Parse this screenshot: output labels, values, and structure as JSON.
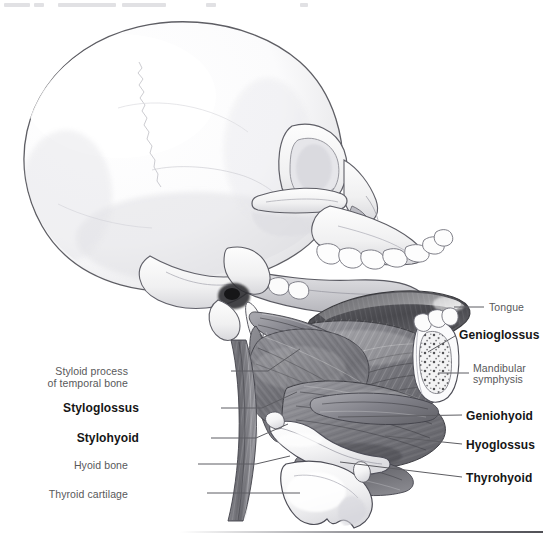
{
  "figure": {
    "style": "grayscale pencil medical illustration",
    "bottom_rule": true
  },
  "labels": [
    {
      "id": "tongue",
      "text": "Tongue",
      "emphasis": "plain",
      "align": "left",
      "side": "right",
      "x": 489,
      "y": 301,
      "leader": [
        [
          454,
          307
        ],
        [
          484,
          307
        ]
      ]
    },
    {
      "id": "genioglossus",
      "text": "Genioglossus",
      "emphasis": "bold",
      "align": "left",
      "side": "right",
      "x": 459,
      "y": 328,
      "leader": [
        [
          428,
          352
        ],
        [
          455,
          336
        ]
      ]
    },
    {
      "id": "mandibular-symphysis-line1",
      "text": "Mandibular",
      "emphasis": "plain",
      "align": "left",
      "side": "right",
      "x": 473,
      "y": 362,
      "leader": [
        [
          438,
          373
        ],
        [
          469,
          373
        ]
      ]
    },
    {
      "id": "mandibular-symphysis-line2",
      "text": "symphysis",
      "emphasis": "plain",
      "align": "left",
      "side": "right",
      "x": 473,
      "y": 373,
      "leader": null
    },
    {
      "id": "geniohyoid",
      "text": "Geniohyoid",
      "emphasis": "bold",
      "align": "left",
      "side": "right",
      "x": 466,
      "y": 409,
      "leader": [
        [
          338,
          417
        ],
        [
          462,
          415
        ]
      ]
    },
    {
      "id": "hyoglossus",
      "text": "Hyoglossus",
      "emphasis": "bold",
      "align": "left",
      "side": "right",
      "x": 466,
      "y": 438,
      "leader": [
        [
          385,
          436
        ],
        [
          462,
          444
        ]
      ]
    },
    {
      "id": "thyrohyoid",
      "text": "Thyrohyoid",
      "emphasis": "bold",
      "align": "left",
      "side": "right",
      "x": 466,
      "y": 471,
      "leader": [
        [
          340,
          462
        ],
        [
          462,
          477
        ]
      ]
    },
    {
      "id": "styloid-process-line1",
      "text": "Styloid process",
      "emphasis": "plain",
      "align": "right",
      "side": "left",
      "x": 128,
      "y": 367,
      "leader": [
        [
          231,
          371
        ],
        [
          268,
          371
        ],
        [
          300,
          349
        ]
      ]
    },
    {
      "id": "styloid-process-line2",
      "text": "of temporal bone",
      "emphasis": "plain",
      "align": "right",
      "side": "left",
      "x": 128,
      "y": 378,
      "leader": null
    },
    {
      "id": "styloglossus",
      "text": "Styloglossus",
      "emphasis": "bold",
      "align": "right",
      "side": "left",
      "x": 139,
      "y": 402,
      "leader": [
        [
          221,
          408
        ],
        [
          262,
          408
        ],
        [
          297,
          392
        ]
      ]
    },
    {
      "id": "stylohyoid",
      "text": "Stylohyoid",
      "emphasis": "bold",
      "align": "right",
      "side": "left",
      "x": 139,
      "y": 432,
      "leader": [
        [
          211,
          438
        ],
        [
          256,
          438
        ],
        [
          288,
          424
        ]
      ]
    },
    {
      "id": "hyoid-bone",
      "text": "Hyoid bone",
      "emphasis": "plain",
      "align": "right",
      "side": "left",
      "x": 128,
      "y": 461,
      "leader": [
        [
          198,
          464
        ],
        [
          256,
          464
        ],
        [
          290,
          456
        ]
      ]
    },
    {
      "id": "thyroid-cartilage",
      "text": "Thyroid cartilage",
      "emphasis": "plain",
      "align": "right",
      "side": "left",
      "x": 128,
      "y": 490,
      "leader": [
        [
          207,
          493
        ],
        [
          300,
          493
        ]
      ]
    }
  ],
  "colors": {
    "background": "#ffffff",
    "plain_label": "#58585a",
    "bold_label": "#161616",
    "leader_line": "#5d5d62",
    "bone_light": "#f2f2f3",
    "bone_mid": "#d6d6d9",
    "bone_shadow": "#a9a9ae",
    "muscle_mid": "#8b8b90",
    "muscle_dark": "#5b5b60",
    "tongue_dark": "#4a4a4e",
    "cartilage": "#f6f6f7",
    "outline": "#4b4b50"
  },
  "structures": [
    {
      "name": "cranium",
      "tone": "very-light"
    },
    {
      "name": "zygomatic-arch",
      "tone": "light"
    },
    {
      "name": "maxilla-with-teeth",
      "tone": "light"
    },
    {
      "name": "mandible-ramus",
      "tone": "light"
    },
    {
      "name": "styloid-process",
      "tone": "light"
    },
    {
      "name": "tongue-body",
      "tone": "dark"
    },
    {
      "name": "genioglossus-muscle",
      "tone": "mid-dark"
    },
    {
      "name": "geniohyoid-muscle",
      "tone": "mid"
    },
    {
      "name": "hyoglossus-muscle",
      "tone": "mid-dark"
    },
    {
      "name": "styloglossus-muscle",
      "tone": "mid"
    },
    {
      "name": "stylohyoid-muscle",
      "tone": "mid"
    },
    {
      "name": "thyrohyoid-muscle",
      "tone": "mid"
    },
    {
      "name": "hyoid-bone",
      "tone": "light"
    },
    {
      "name": "thyroid-cartilage",
      "tone": "very-light"
    },
    {
      "name": "mandibular-symphysis-cut",
      "tone": "trabecular"
    }
  ],
  "top_smudges": [
    {
      "x": 4,
      "w": 26
    },
    {
      "x": 34,
      "w": 10
    },
    {
      "x": 58,
      "w": 58
    },
    {
      "x": 122,
      "w": 44
    },
    {
      "x": 206,
      "w": 10
    },
    {
      "x": 300,
      "w": 8
    }
  ]
}
